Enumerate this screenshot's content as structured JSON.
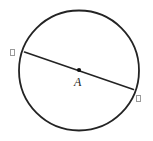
{
  "figure": {
    "type": "circle-with-diameter",
    "background_color": "#ffffff",
    "stroke_color": "#232323",
    "label_color": "#1a1a1a",
    "tofu_color": "#9a9a9a",
    "canvas": {
      "width": 153,
      "height": 141
    },
    "circle": {
      "center_x": 79,
      "center_y": 70.5,
      "radius": 60,
      "stroke_width": 1.8
    },
    "diameter": {
      "x1": 24.5,
      "y1": 52,
      "x2": 133.5,
      "y2": 89.5,
      "stroke_width": 1.6
    },
    "center_point": {
      "x": 79,
      "y": 70,
      "radius": 2.1
    },
    "labels": {
      "center": "A",
      "endpoint_left": "",
      "endpoint_right": ""
    },
    "label_positions": {
      "center": {
        "x": 74,
        "y": 76
      },
      "endpoint_left": {
        "x": 10,
        "y": 49
      },
      "endpoint_right": {
        "x": 136,
        "y": 95
      }
    }
  }
}
